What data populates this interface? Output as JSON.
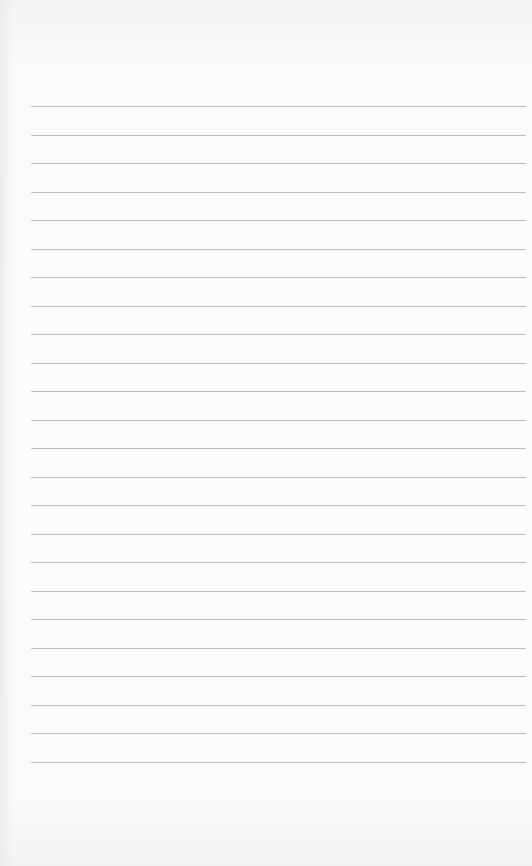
{
  "page": {
    "type": "lined-paper",
    "background_color": "#fbfbfa",
    "rule_color": "#bdbdbb",
    "rules": {
      "count": 24,
      "first_y": 106,
      "spacing": 28.5,
      "left": 31,
      "right": 526
    },
    "text": ""
  }
}
